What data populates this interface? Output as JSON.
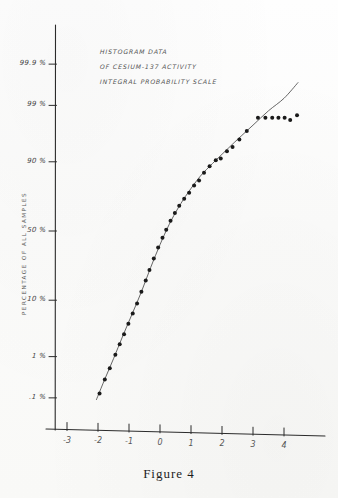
{
  "figure": {
    "caption": "Figure 4",
    "annotation_lines": [
      "HISTOGRAM  DATA",
      "OF  CESIUM-137 ACTIVITY",
      "INTEGRAL PROBABILITY SCALE"
    ],
    "yaxis_title": "PERCENTAGE  OF  ALL  SAMPLES"
  },
  "chart_data": {
    "type": "scatter",
    "title": "HISTOGRAM DATA OF CESIUM-137 ACTIVITY",
    "subtitle": "INTEGRAL PROBABILITY SCALE",
    "xlabel": "",
    "ylabel": "PERCENTAGE OF ALL SAMPLES",
    "grid": false,
    "legend": null,
    "xlim": [
      -3.6,
      4.8
    ],
    "xticks": [
      -3,
      -2,
      -1,
      0,
      1,
      2,
      3,
      4
    ],
    "xticklabels": [
      "-3",
      "-2",
      "-1",
      "0",
      "1",
      "2",
      "3",
      "4"
    ],
    "yscale": "probability",
    "yticks": [
      0.1,
      1,
      10,
      50,
      90,
      99,
      99.9
    ],
    "yticklabels": [
      ".1 %",
      "1 %",
      "10 %",
      "50 %",
      "90 %",
      "99 %",
      "99.9 %"
    ],
    "ylim": [
      0.04,
      99.95
    ],
    "points": [
      {
        "x": -1.95,
        "y": 0.13
      },
      {
        "x": -1.78,
        "y": 0.3
      },
      {
        "x": -1.62,
        "y": 0.55
      },
      {
        "x": -1.44,
        "y": 1.1
      },
      {
        "x": -1.3,
        "y": 1.8
      },
      {
        "x": -1.16,
        "y": 2.8
      },
      {
        "x": -1.02,
        "y": 4.3
      },
      {
        "x": -0.88,
        "y": 6.3
      },
      {
        "x": -0.74,
        "y": 9.0
      },
      {
        "x": -0.6,
        "y": 13.0
      },
      {
        "x": -0.46,
        "y": 18.0
      },
      {
        "x": -0.34,
        "y": 23.5
      },
      {
        "x": -0.2,
        "y": 30.5
      },
      {
        "x": -0.06,
        "y": 38.0
      },
      {
        "x": 0.08,
        "y": 45.0
      },
      {
        "x": 0.2,
        "y": 51.0
      },
      {
        "x": 0.34,
        "y": 57.5
      },
      {
        "x": 0.48,
        "y": 63.0
      },
      {
        "x": 0.62,
        "y": 68.0
      },
      {
        "x": 0.78,
        "y": 72.5
      },
      {
        "x": 0.94,
        "y": 76.0
      },
      {
        "x": 1.1,
        "y": 80.0
      },
      {
        "x": 1.26,
        "y": 82.5
      },
      {
        "x": 1.42,
        "y": 86.0
      },
      {
        "x": 1.6,
        "y": 88.5
      },
      {
        "x": 1.8,
        "y": 90.5
      },
      {
        "x": 1.96,
        "y": 91.0
      },
      {
        "x": 2.16,
        "y": 93.0
      },
      {
        "x": 2.34,
        "y": 94.0
      },
      {
        "x": 2.56,
        "y": 95.5
      },
      {
        "x": 2.8,
        "y": 96.8
      },
      {
        "x": 3.16,
        "y": 98.2
      },
      {
        "x": 3.4,
        "y": 98.2
      },
      {
        "x": 3.62,
        "y": 98.2
      },
      {
        "x": 3.82,
        "y": 98.2
      },
      {
        "x": 4.02,
        "y": 98.2
      },
      {
        "x": 4.2,
        "y": 98.0
      },
      {
        "x": 4.42,
        "y": 98.4
      }
    ],
    "fit_curve": [
      {
        "x": -2.05,
        "y": 0.09
      },
      {
        "x": -1.8,
        "y": 0.28
      },
      {
        "x": -1.5,
        "y": 0.9
      },
      {
        "x": -1.2,
        "y": 2.6
      },
      {
        "x": -0.9,
        "y": 6.2
      },
      {
        "x": -0.6,
        "y": 13.0
      },
      {
        "x": -0.3,
        "y": 25.0
      },
      {
        "x": 0.0,
        "y": 40.0
      },
      {
        "x": 0.3,
        "y": 55.0
      },
      {
        "x": 0.6,
        "y": 67.0
      },
      {
        "x": 0.9,
        "y": 76.0
      },
      {
        "x": 1.3,
        "y": 84.5
      },
      {
        "x": 1.7,
        "y": 89.5
      },
      {
        "x": 2.1,
        "y": 93.0
      },
      {
        "x": 2.5,
        "y": 95.5
      },
      {
        "x": 3.0,
        "y": 97.5
      },
      {
        "x": 3.5,
        "y": 98.7
      },
      {
        "x": 4.0,
        "y": 99.3
      },
      {
        "x": 4.45,
        "y": 99.7
      }
    ]
  },
  "style": {
    "ink": "#1a1a1a",
    "axis": "#2b2b2b",
    "paper": "#fbfbfa"
  }
}
